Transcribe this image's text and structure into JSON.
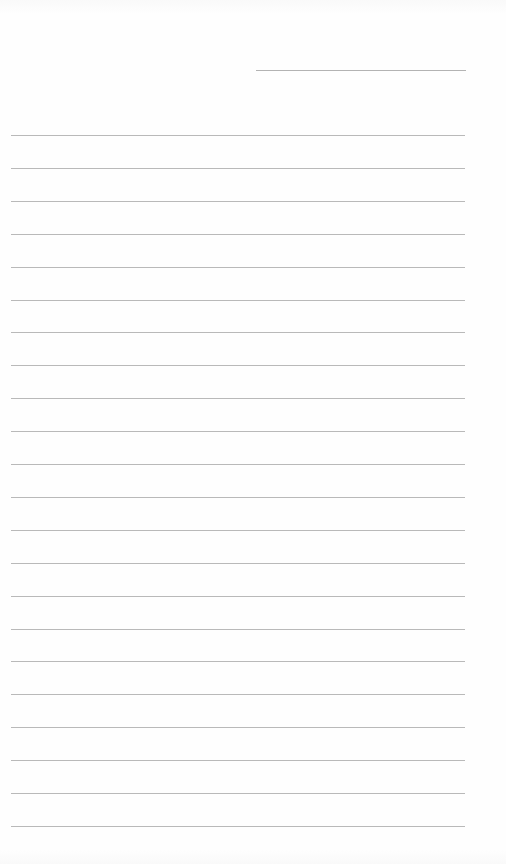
{
  "document": {
    "type": "lined-writing-page",
    "header_line": {
      "x1": 256,
      "x2": 466,
      "y": 70
    },
    "lines": {
      "count": 22,
      "x1": 11,
      "x2": 465,
      "first_y": 135,
      "spacing": 32.9
    },
    "rule_color": "#b9b9b9",
    "background": "#fefefe"
  }
}
